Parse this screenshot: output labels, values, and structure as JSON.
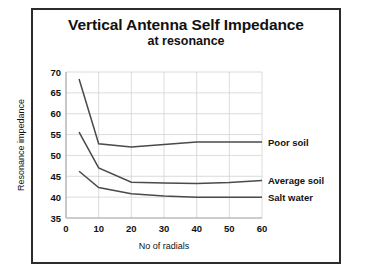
{
  "chart_data": {
    "type": "line",
    "title": "Vertical Antenna Self Impedance",
    "subtitle": "at resonance",
    "xlabel": "No  of radials",
    "ylabel": "Resonance impedance",
    "xlim": [
      0,
      60
    ],
    "ylim": [
      35,
      70
    ],
    "x_ticks": [
      0,
      10,
      20,
      30,
      40,
      50,
      60
    ],
    "y_ticks": [
      35,
      40,
      45,
      50,
      55,
      60,
      65,
      70
    ],
    "grid": true,
    "legend_position": "right-inline",
    "x": [
      4,
      10,
      20,
      30,
      40,
      50,
      60
    ],
    "series": [
      {
        "name": "Poor soil",
        "label": "Poor soil",
        "color": "#4a4a4a",
        "values": [
          68.3,
          52.8,
          52.0,
          52.6,
          53.2,
          53.2,
          53.2
        ]
      },
      {
        "name": "Average soil",
        "label": "Average soil",
        "color": "#4a4a4a",
        "values": [
          55.6,
          47.0,
          43.6,
          43.4,
          43.3,
          43.5,
          44.0
        ]
      },
      {
        "name": "Salt water",
        "label": "Salt water",
        "color": "#4a4a4a",
        "values": [
          46.2,
          42.3,
          40.8,
          40.3,
          40.0,
          40.0,
          40.0
        ]
      }
    ]
  }
}
